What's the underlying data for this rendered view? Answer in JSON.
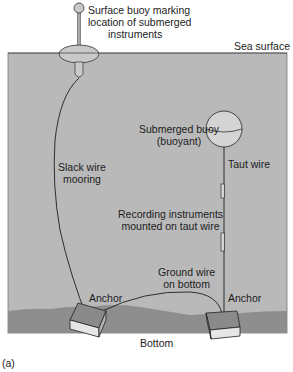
{
  "diagram": {
    "panel_label": "(a)",
    "labels": {
      "surface_buoy": [
        "Surface buoy marking",
        "location of submerged",
        "instruments"
      ],
      "sea_surface": "Sea surface",
      "submerged_buoy": [
        "Submerged buoy",
        "(buoyant)"
      ],
      "taut_wire": "Taut wire",
      "slack_wire": [
        "Slack wire",
        "mooring"
      ],
      "recording_instruments": [
        "Recording instruments",
        "mounted on taut wire"
      ],
      "ground_wire": [
        "Ground wire",
        "on bottom"
      ],
      "anchor_left": "Anchor",
      "anchor_right": "Anchor",
      "bottom": "Bottom"
    },
    "colors": {
      "water": "#b9b9b9",
      "seabed": "#8e8e8e",
      "buoy": "#d4d4d4",
      "anchor_top": "#8a8a8a",
      "anchor_side": "#e6e6e6",
      "line": "#1e1e1e"
    }
  }
}
